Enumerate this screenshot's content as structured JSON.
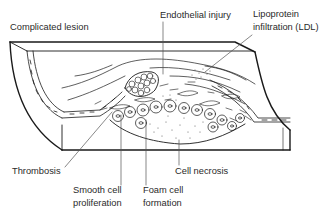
{
  "diagram": {
    "colors": {
      "line": "#1a1a1a",
      "text": "#2a2a2a",
      "background": "#ffffff"
    },
    "labels": {
      "complicated_lesion": "Complicated lesion",
      "endothelial_injury": "Endothelial injury",
      "lipoprotein_line1": "Lipoprotein",
      "lipoprotein_line2": "infiltration (LDL)",
      "thrombosis": "Thrombosis",
      "smooth_cell_line1": "Smooth cell",
      "smooth_cell_line2": "proliferation",
      "foam_cell_line1": "Foam cell",
      "foam_cell_line2": "formation",
      "cell_necrosis": "Cell necrosis"
    }
  }
}
